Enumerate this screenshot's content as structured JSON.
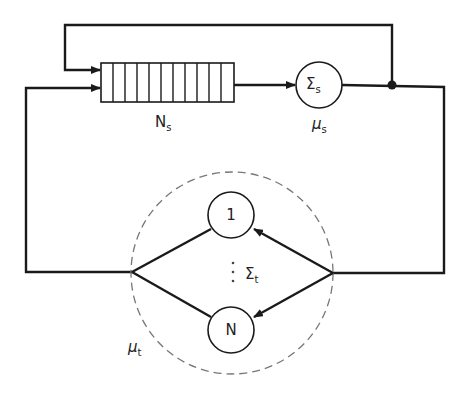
{
  "diagram": {
    "type": "closed queueing network",
    "queue": {
      "label_main": "N",
      "label_sub": "s",
      "cell_count": 11
    },
    "server_s": {
      "symbol_main": "Σ",
      "symbol_sub": "s",
      "rate_main": "μ",
      "rate_sub": "s"
    },
    "terminal_group": {
      "node_first": "1",
      "node_last": "N",
      "vdots": "⋮",
      "symbol_main": "Σ",
      "symbol_sub": "t",
      "rate_main": "μ",
      "rate_sub": "t"
    },
    "colors": {
      "line": "#1a1a1a",
      "dashed_boundary": "#777777",
      "background": "#ffffff"
    }
  }
}
